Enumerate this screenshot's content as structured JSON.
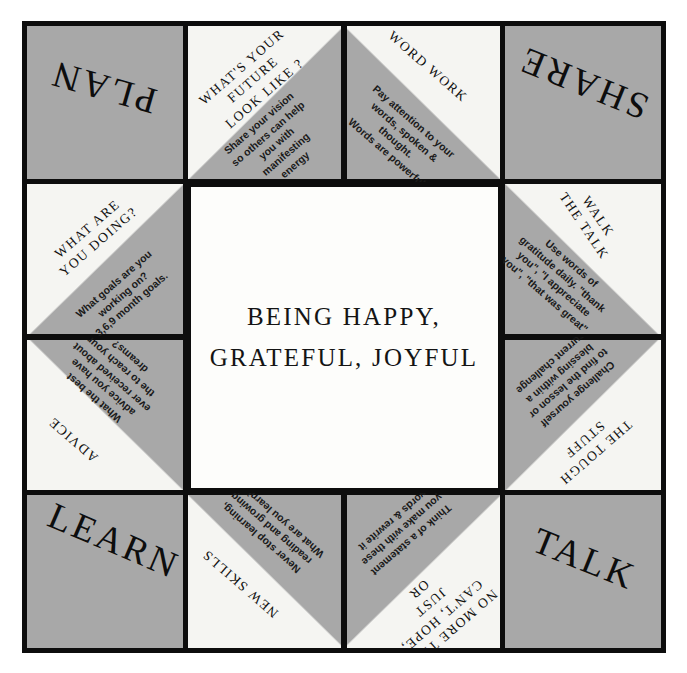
{
  "center": {
    "line1": "BEING HAPPY,",
    "line2": "GRATEFUL, JOYFUL"
  },
  "corners": {
    "top_left": "PLAN",
    "top_right": "SHARE",
    "bottom_left": "LEARN",
    "bottom_right": "TALK"
  },
  "flaps": [
    {
      "id": "future",
      "title": "WHAT'S YOUR\nFUTURE\nLOOK LIKE ?",
      "body": "Share your vision\nso others can help\nyou with\nmanifesting\nenergy"
    },
    {
      "id": "word-work",
      "title": "WORD WORK",
      "body": "Pay attention to your\nwords, spoken & thought.\nWords are powerful"
    },
    {
      "id": "what-are-you-doing",
      "title": "WHAT ARE\nYOU DOING?",
      "body": "What goals are you\nworking on?\n3,6,9 month goals."
    },
    {
      "id": "walk-the-talk",
      "title": "WALK\nTHE TALK",
      "body": "Use words of\ngratitude daily. \"thank\nyou\", \"I appreciate\nyou\", \"that was great\""
    },
    {
      "id": "advice",
      "title": "ADVICE",
      "body": "What the best\nadvice you have\never received about\nthe  to reach your\ndreams?"
    },
    {
      "id": "the-tough-stuff",
      "title": "THE TOUGH\nSTUFF",
      "body": "Challenge yourself\nto find the lesson or\nblessing within a\ncurrent challenge"
    },
    {
      "id": "new-skills",
      "title": "NEW SKILLS",
      "body": "Never stop learning,\nreading and growing.\nWhat are you learning?"
    },
    {
      "id": "no-more",
      "title": "NO MORE TRY,\nCAN'T, HOPE, JUST\nOR",
      "body": "Think of a statement\nyou make with these\nwords & rewrite it"
    }
  ],
  "colors": {
    "gray": "#a8a8a8",
    "paper": "#f5f5f2",
    "ink": "#0d0d0d"
  }
}
